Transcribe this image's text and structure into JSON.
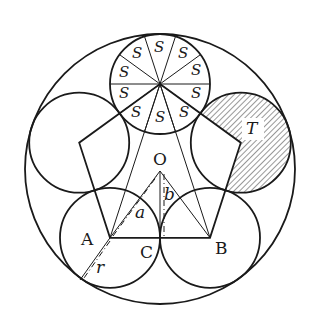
{
  "diagram": {
    "type": "geometry-figure",
    "colors": {
      "stroke": "#1a1a1a",
      "background": "#ffffff",
      "hatch": "#333333"
    },
    "points": {
      "A": "A",
      "B": "B",
      "C": "C",
      "O": "O"
    },
    "segment_labels": {
      "a": "a",
      "b": "b",
      "r": "r"
    },
    "regions": {
      "sector_label": "S",
      "sector_count": 10,
      "sectors": [
        "S",
        "S",
        "S",
        "S",
        "S",
        "S",
        "S",
        "S",
        "S",
        "S"
      ],
      "hatched_label": "T"
    }
  }
}
